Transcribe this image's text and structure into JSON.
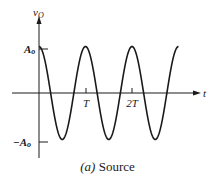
{
  "chart_data": {
    "type": "line",
    "title": "",
    "caption_label": "(a)",
    "caption_text": "Source",
    "xlabel": "t",
    "ylabel": "v_O",
    "ylabel_main": "v",
    "ylabel_sub": "O",
    "x_ticks": [
      {
        "value": 1,
        "label": "T"
      },
      {
        "value": 2,
        "label": "2T"
      }
    ],
    "y_ticks": [
      {
        "value": 1,
        "label": "A_o",
        "main": "A",
        "sub": "o"
      },
      {
        "value": -1,
        "label": "-A_o",
        "main": "−A",
        "sub": "o"
      }
    ],
    "series": [
      {
        "name": "v_O(t) = A_o cos(2πt/T)",
        "function": "cosine",
        "amplitude": 1,
        "period": 1,
        "x_range": [
          0,
          3
        ],
        "samples": [
          [
            0,
            1
          ],
          [
            0.25,
            0
          ],
          [
            0.5,
            -1
          ],
          [
            0.75,
            0
          ],
          [
            1,
            1
          ],
          [
            1.25,
            0
          ],
          [
            1.5,
            -1
          ],
          [
            1.75,
            0
          ],
          [
            2,
            1
          ],
          [
            2.25,
            0
          ],
          [
            2.5,
            -1
          ],
          [
            2.75,
            0
          ],
          [
            3,
            1
          ]
        ]
      }
    ],
    "grid": false,
    "legend": false,
    "ylim": [
      -1.1,
      1.1
    ]
  },
  "colors": {
    "ink": "#1a1a1a",
    "background": "#ffffff"
  }
}
